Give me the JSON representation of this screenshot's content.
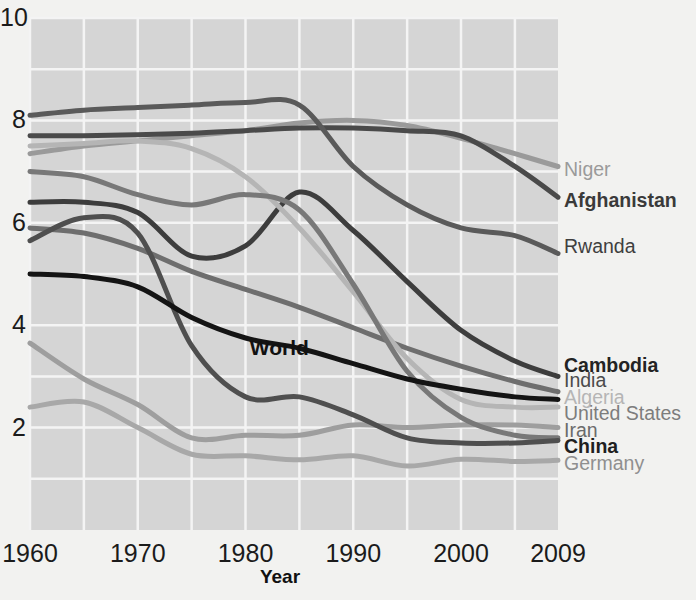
{
  "chart_data": {
    "type": "line",
    "title": "",
    "xlabel": "Year",
    "ylabel": "",
    "xlim": [
      1960,
      2009
    ],
    "ylim": [
      0,
      10
    ],
    "grid": true,
    "grid_x_step": 5,
    "grid_y_step": 1,
    "legend_position": "right-end-labels",
    "xticks": [
      "1960",
      "1970",
      "1980",
      "1990",
      "2000",
      "2009"
    ],
    "xtick_values": [
      1960,
      1970,
      1980,
      1990,
      2000,
      2009
    ],
    "yticks": [
      "2",
      "4",
      "6",
      "8",
      "10"
    ],
    "ytick_values": [
      2,
      4,
      6,
      8,
      10
    ],
    "annotations": [
      {
        "text": "World",
        "x": 1983,
        "y": 3.55
      }
    ],
    "x": [
      1960,
      1965,
      1970,
      1975,
      1980,
      1985,
      1990,
      1995,
      2000,
      2005,
      2009
    ],
    "series": [
      {
        "name": "Niger",
        "color": "#9a9a9a",
        "width": 5,
        "label_color": "#9a9a9a",
        "label_weight": "normal",
        "label_y": 7.05,
        "values": [
          7.35,
          7.5,
          7.6,
          7.7,
          7.8,
          7.95,
          8.0,
          7.9,
          7.65,
          7.35,
          7.1
        ]
      },
      {
        "name": "Afghanistan",
        "color": "#4a4a4a",
        "width": 5,
        "label_color": "#3a3a3a",
        "label_weight": "bold",
        "label_y": 6.45,
        "values": [
          7.7,
          7.7,
          7.72,
          7.75,
          7.8,
          7.85,
          7.85,
          7.8,
          7.7,
          7.1,
          6.5
        ]
      },
      {
        "name": "Rwanda",
        "color": "#5a5a5a",
        "width": 5,
        "label_color": "#3f3f3f",
        "label_weight": "normal",
        "label_y": 5.55,
        "values": [
          8.1,
          8.2,
          8.25,
          8.3,
          8.35,
          8.3,
          7.1,
          6.35,
          5.9,
          5.75,
          5.4
        ]
      },
      {
        "name": "Cambodia",
        "color": "#3d3d3d",
        "width": 5,
        "label_color": "#232323",
        "label_weight": "bold",
        "label_y": 3.22,
        "values": [
          6.4,
          6.4,
          6.2,
          5.35,
          5.55,
          6.6,
          5.85,
          4.85,
          3.9,
          3.3,
          3.0
        ]
      },
      {
        "name": "India",
        "color": "#6e6e6e",
        "width": 5,
        "label_color": "#4b4b4b",
        "label_weight": "normal",
        "label_y": 2.92,
        "values": [
          5.9,
          5.8,
          5.5,
          5.05,
          4.7,
          4.35,
          3.95,
          3.55,
          3.2,
          2.9,
          2.7
        ]
      },
      {
        "name": "Algeria",
        "color": "#b5b5b5",
        "width": 5,
        "label_color": "#b5b5b5",
        "label_weight": "normal",
        "label_y": 2.6,
        "values": [
          7.5,
          7.55,
          7.6,
          7.45,
          6.9,
          5.9,
          4.65,
          3.35,
          2.55,
          2.4,
          2.4
        ]
      },
      {
        "name": "United States",
        "color": "#9e9e9e",
        "width": 5,
        "label_color": "#7d7d7d",
        "label_weight": "normal",
        "label_y": 2.28,
        "values": [
          3.65,
          2.95,
          2.45,
          1.8,
          1.85,
          1.85,
          2.05,
          2.0,
          2.05,
          2.05,
          2.0
        ]
      },
      {
        "name": "Iran",
        "color": "#787878",
        "width": 5,
        "label_color": "#6b6b6b",
        "label_weight": "normal",
        "label_y": 1.96,
        "values": [
          7.0,
          6.9,
          6.55,
          6.35,
          6.55,
          6.25,
          4.8,
          3.1,
          2.2,
          1.85,
          1.8
        ]
      },
      {
        "name": "China",
        "color": "#4f4f4f",
        "width": 5,
        "label_color": "#1f1f1f",
        "label_weight": "bold",
        "label_y": 1.64,
        "values": [
          5.65,
          6.1,
          5.8,
          3.6,
          2.6,
          2.6,
          2.25,
          1.8,
          1.7,
          1.7,
          1.75
        ]
      },
      {
        "name": "Germany",
        "color": "#a8a8a8",
        "width": 5,
        "label_color": "#8f8f8f",
        "label_weight": "normal",
        "label_y": 1.3,
        "values": [
          2.4,
          2.5,
          2.0,
          1.48,
          1.45,
          1.37,
          1.45,
          1.25,
          1.38,
          1.34,
          1.36
        ]
      },
      {
        "name": "World",
        "color": "#141414",
        "width": 5,
        "label_color": "#111111",
        "label_weight": "bold",
        "label_y": null,
        "values": [
          5.0,
          4.95,
          4.75,
          4.15,
          3.75,
          3.55,
          3.25,
          2.95,
          2.75,
          2.6,
          2.55
        ]
      }
    ]
  }
}
